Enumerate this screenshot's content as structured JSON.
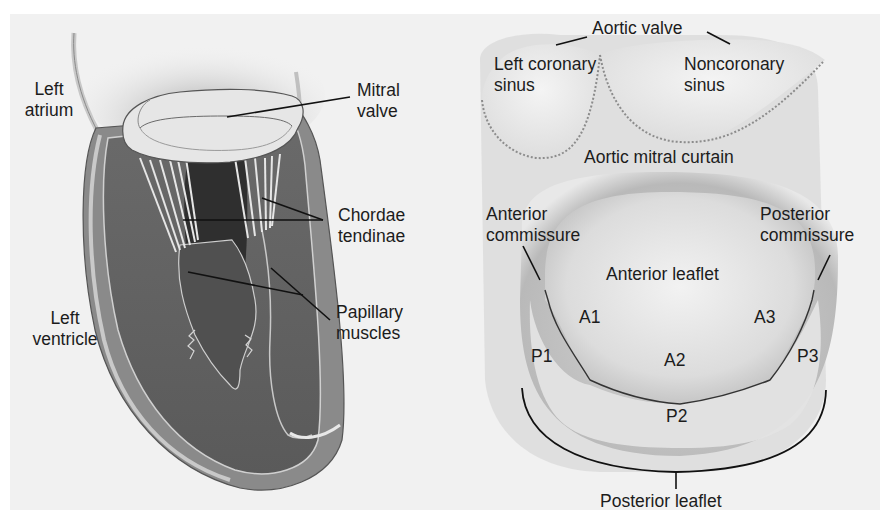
{
  "figure": {
    "background_color": "#f1f1f1",
    "left_panel": {
      "title": "Heart cross-section",
      "labels": {
        "left_atrium": "Left\natrium",
        "mitral_valve": "Mitral\nvalve",
        "chordae_tendinae": "Chordae\ntendinae",
        "papillary_muscles": "Papillary\nmuscles",
        "left_ventricle": "Left\nventricle"
      }
    },
    "right_panel": {
      "title": "Mitral valve surgical view",
      "labels": {
        "aortic_valve": "Aortic valve",
        "left_coronary_sinus": "Left coronary\nsinus",
        "noncoronary_sinus": "Noncoronary\nsinus",
        "aortic_mitral_curtain": "Aortic mitral curtain",
        "anterior_commissure": "Anterior\ncommissure",
        "posterior_commissure": "Posterior\ncommissure",
        "anterior_leaflet": "Anterior leaflet",
        "posterior_leaflet": "Posterior leaflet"
      },
      "segments": {
        "a1": "A1",
        "a2": "A2",
        "a3": "A3",
        "p1": "P1",
        "p2": "P2",
        "p3": "P3"
      }
    }
  }
}
